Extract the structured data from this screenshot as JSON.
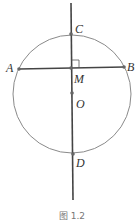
{
  "figure": {
    "caption": "图 1.2",
    "colors": {
      "circle": "#8a8a8a",
      "line": "#444444",
      "point": "#666666",
      "label": "#333333"
    },
    "circle": {
      "center": "O",
      "cx": 72,
      "cy": 94,
      "r": 59
    },
    "points": [
      {
        "name": "C",
        "label": "C",
        "x": 71,
        "y": 34
      },
      {
        "name": "A",
        "label": "A",
        "x": 19,
        "y": 69
      },
      {
        "name": "B",
        "label": "B",
        "x": 124,
        "y": 67
      },
      {
        "name": "M",
        "label": "M",
        "x": 71,
        "y": 68
      },
      {
        "name": "O",
        "label": "O",
        "x": 72,
        "y": 93
      },
      {
        "name": "D",
        "label": "D",
        "x": 73,
        "y": 154
      }
    ],
    "segments": [
      {
        "name": "chord-AB",
        "from": "A",
        "to": "B"
      },
      {
        "name": "line-CD",
        "from": [
          71,
          3
        ],
        "to": [
          73,
          200
        ]
      }
    ],
    "right_angle_at": "M"
  }
}
